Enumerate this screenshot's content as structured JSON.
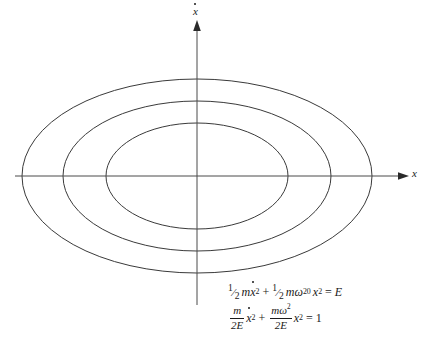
{
  "figure": {
    "background_color": "#ffffff",
    "line_color": "#3a3a3a",
    "text_color": "#1a1a1a",
    "width": 429,
    "height": 350
  },
  "axes": {
    "x_axis": {
      "label": "x",
      "label_name": "x-axis-label",
      "from_x": 15,
      "to_x": 405,
      "y": 176,
      "arrow": "right"
    },
    "y_axis": {
      "label": "ẋ",
      "label_base": "x",
      "label_accent": "dot",
      "label_name": "xdot-axis-label",
      "x": 197,
      "from_y": 305,
      "to_y": 22,
      "arrow": "up"
    },
    "origin": {
      "x": 197,
      "y": 176
    }
  },
  "chart_data": {
    "type": "line",
    "title": "",
    "xlabel": "x",
    "ylabel": "ẋ",
    "grid": false,
    "legend": false,
    "xlim": [
      -175,
      175
    ],
    "ylim": [
      -97,
      97
    ],
    "curve_kind": "ellipse",
    "center": {
      "x": 197,
      "y": 176
    },
    "curves": [
      {
        "name": "inner-energy-contour",
        "semi_major_x": 91,
        "semi_minor_y": 53,
        "x_intercepts": [
          -91,
          91
        ],
        "y_intercepts": [
          -53,
          53
        ]
      },
      {
        "name": "middle-energy-contour",
        "semi_major_x": 134,
        "semi_minor_y": 75,
        "x_intercepts": [
          -134,
          134
        ],
        "y_intercepts": [
          -75,
          75
        ]
      },
      {
        "name": "outer-energy-contour",
        "semi_major_x": 175,
        "semi_minor_y": 97,
        "x_intercepts": [
          -175,
          175
        ],
        "y_intercepts": [
          -97,
          97
        ]
      }
    ]
  },
  "equations": {
    "equation1": {
      "plain": "1/2 m ẋ^2 + 1/2 m ω_0^2 x^2 = E",
      "half_num": "1",
      "half_slash": "⁄",
      "half_den": "2",
      "m": "m",
      "xdot": "x",
      "sq": "2",
      "plus": "+",
      "omega": "ω",
      "omega_sub": "0",
      "x": "x",
      "equals": "=",
      "rhs": "E"
    },
    "equation2": {
      "plain": "m/(2E) ẋ^2 + mω^2/(2E) x^2 = 1",
      "frac1_num": "m",
      "frac1_den": "2E",
      "xdot": "x",
      "sq": "2",
      "plus": "+",
      "frac2_num_m": "m",
      "frac2_num_omega": "ω",
      "frac2_num_sq": "2",
      "frac2_den": "2E",
      "x": "x",
      "equals": "=",
      "rhs": "1"
    }
  }
}
